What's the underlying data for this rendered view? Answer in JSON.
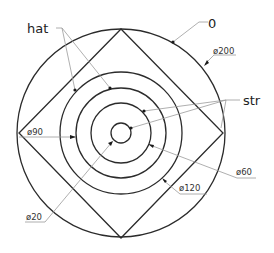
{
  "diagram": {
    "type": "technical-drawing",
    "center": [
      121,
      133
    ],
    "circles": [
      {
        "name": "outer",
        "diameter": 200,
        "r": 104
      },
      {
        "name": "ring-120",
        "diameter": 120,
        "r": 61
      },
      {
        "name": "ring-90",
        "diameter": 90,
        "r": 45
      },
      {
        "name": "ring-60",
        "diameter": 60,
        "r": 30
      },
      {
        "name": "ring-20",
        "diameter": 20,
        "r": 10
      }
    ],
    "square": {
      "vertices": [
        [
          121,
          29
        ],
        [
          223,
          133
        ],
        [
          121,
          238
        ],
        [
          19,
          133
        ]
      ]
    },
    "labels": {
      "hat": "hat",
      "zero": "0",
      "str": "str",
      "d200": "ø200",
      "d90": "ø90",
      "d60": "ø60",
      "d120": "ø120",
      "d20": "ø20"
    }
  }
}
